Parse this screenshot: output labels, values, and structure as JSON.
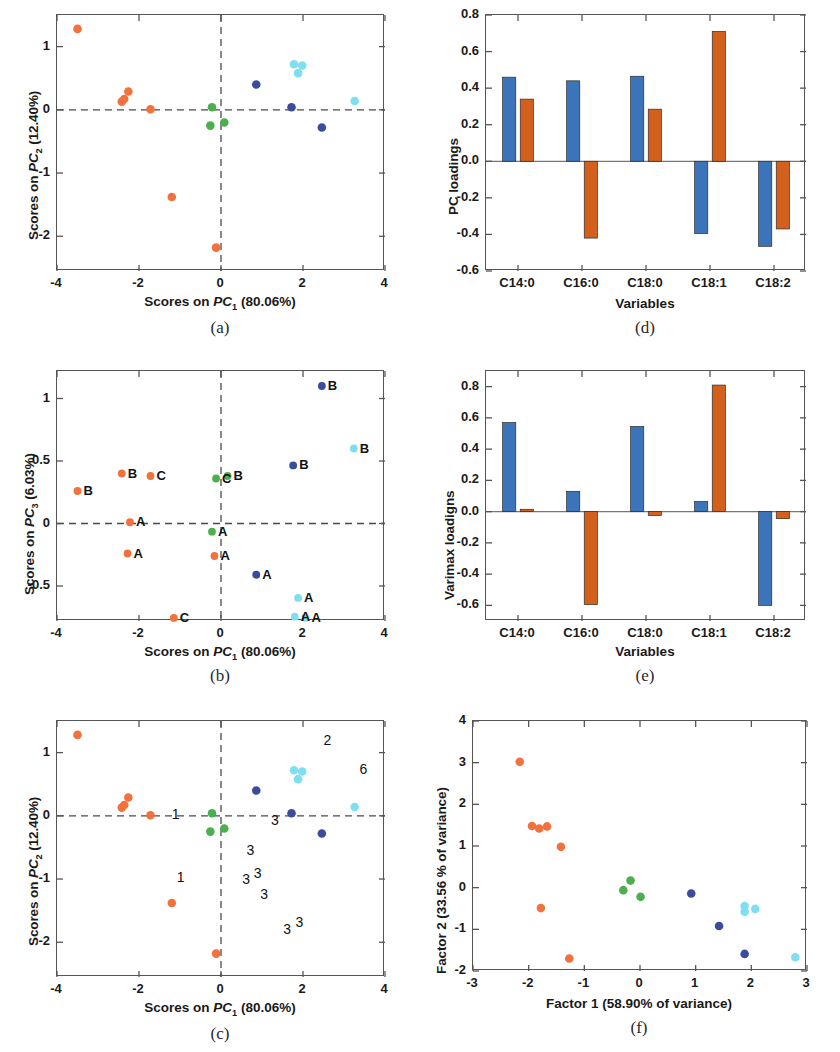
{
  "figure": {
    "panels": [
      "a",
      "b",
      "c",
      "d",
      "e",
      "f"
    ],
    "captions": {
      "a": "(a)",
      "b": "(b)",
      "c": "(c)",
      "d": "(d)",
      "e": "(e)",
      "f": "(f)"
    }
  },
  "colors": {
    "orange_point": "#f2713c",
    "green_point": "#4caf4f",
    "darkblue_point": "#3b4c9e",
    "cyan_point": "#7fdff2",
    "bar_blue": "#3b74b8",
    "bar_orange": "#d4601e",
    "axis": "#555555",
    "dashed": "#4a4a4a"
  },
  "chart_data": [
    {
      "panel": "a",
      "type": "scatter",
      "title": "",
      "xlabel": "Scores on PC1 (80.06%)",
      "ylabel": "Scores on PC2 (12.40%)",
      "xlim": [
        -4,
        4
      ],
      "ylim": [
        -2.55,
        1.5
      ],
      "xticks": [
        -4,
        -2,
        0,
        2,
        4
      ],
      "xticklabels": [
        "-4",
        "-2",
        "0",
        "2",
        "4"
      ],
      "yticks": [
        1,
        0,
        -1,
        -2
      ],
      "yticklabels": [
        "1",
        "0",
        "-1",
        "-2"
      ],
      "grid": false,
      "reference_lines": {
        "hline": 0,
        "vline": 0,
        "style": "dashed"
      },
      "series": [
        {
          "name": "orange",
          "color": "#f2713c",
          "points": [
            [
              -3.5,
              1.28
            ],
            [
              -2.42,
              0.13
            ],
            [
              -2.36,
              0.17
            ],
            [
              -2.26,
              0.29
            ],
            [
              -1.72,
              0.01
            ],
            [
              -1.2,
              -1.38
            ],
            [
              -0.12,
              -2.18
            ]
          ]
        },
        {
          "name": "green",
          "color": "#4caf4f",
          "points": [
            [
              -0.22,
              0.04
            ],
            [
              -0.26,
              -0.25
            ],
            [
              0.08,
              -0.2
            ]
          ]
        },
        {
          "name": "darkblue",
          "color": "#3b4c9e",
          "points": [
            [
              0.86,
              0.4
            ],
            [
              1.72,
              0.04
            ],
            [
              2.46,
              -0.28
            ]
          ]
        },
        {
          "name": "cyan",
          "color": "#7fdff2",
          "points": [
            [
              1.78,
              0.72
            ],
            [
              1.98,
              0.7
            ],
            [
              1.88,
              0.58
            ],
            [
              3.26,
              0.14
            ]
          ]
        }
      ]
    },
    {
      "panel": "b",
      "type": "scatter",
      "title": "",
      "xlabel": "Scores on PC1 (80.06%)",
      "ylabel": "Scores on PC3 (6.03%)",
      "xlim": [
        -4,
        4
      ],
      "ylim": [
        -0.78,
        1.22
      ],
      "xticks": [
        -4,
        -2,
        0,
        2,
        4
      ],
      "xticklabels": [
        "-4",
        "-2",
        "0",
        "2",
        "4"
      ],
      "yticks": [
        1,
        0.5,
        0,
        -0.5
      ],
      "yticklabels": [
        "1",
        "0.5",
        "0",
        "-0.5"
      ],
      "grid": false,
      "reference_lines": {
        "hline": 0,
        "vline": 0,
        "style": "dashed"
      },
      "series": [
        {
          "name": "orange",
          "color": "#f2713c",
          "points": [
            [
              -3.5,
              0.26
            ],
            [
              -2.42,
              0.4
            ],
            [
              -1.72,
              0.38
            ],
            [
              -2.22,
              0.01
            ],
            [
              -2.28,
              -0.24
            ],
            [
              -0.16,
              -0.26
            ],
            [
              -1.15,
              -0.755
            ]
          ]
        },
        {
          "name": "green",
          "color": "#4caf4f",
          "points": [
            [
              -0.12,
              0.36
            ],
            [
              0.16,
              0.38
            ],
            [
              -0.22,
              -0.065
            ]
          ]
        },
        {
          "name": "darkblue",
          "color": "#3b4c9e",
          "points": [
            [
              2.46,
              1.1
            ],
            [
              1.76,
              0.465
            ],
            [
              0.86,
              -0.41
            ]
          ]
        },
        {
          "name": "cyan",
          "color": "#7fdff2",
          "points": [
            [
              3.24,
              0.6
            ],
            [
              1.88,
              -0.595
            ],
            [
              1.8,
              -0.745
            ],
            [
              2.06,
              -0.755
            ]
          ]
        }
      ],
      "point_labels": [
        {
          "text": "B",
          "x": -3.5,
          "y": 0.26
        },
        {
          "text": "B",
          "x": -2.42,
          "y": 0.4
        },
        {
          "text": "C",
          "x": -1.72,
          "y": 0.38
        },
        {
          "text": "A",
          "x": -2.22,
          "y": 0.01
        },
        {
          "text": "A",
          "x": -2.28,
          "y": -0.24
        },
        {
          "text": "C",
          "x": -0.12,
          "y": 0.36
        },
        {
          "text": "B",
          "x": 0.16,
          "y": 0.38
        },
        {
          "text": "A",
          "x": -0.22,
          "y": -0.065
        },
        {
          "text": "A",
          "x": -0.16,
          "y": -0.26
        },
        {
          "text": "C",
          "x": -1.15,
          "y": -0.755
        },
        {
          "text": "B",
          "x": 2.46,
          "y": 1.1
        },
        {
          "text": "B",
          "x": 3.24,
          "y": 0.6
        },
        {
          "text": "B",
          "x": 1.76,
          "y": 0.465
        },
        {
          "text": "A",
          "x": 0.86,
          "y": -0.41
        },
        {
          "text": "A",
          "x": 1.88,
          "y": -0.595
        },
        {
          "text": "A",
          "x": 1.8,
          "y": -0.745
        },
        {
          "text": "A",
          "x": 2.06,
          "y": -0.755
        }
      ]
    },
    {
      "panel": "c",
      "type": "scatter",
      "title": "",
      "xlabel": "Scores on PC1 (80.06%)",
      "ylabel": "Scores on PC2 (12.40%)",
      "xlim": [
        -4,
        4
      ],
      "ylim": [
        -2.55,
        1.5
      ],
      "xticks": [
        -4,
        -2,
        0,
        2,
        4
      ],
      "xticklabels": [
        "-4",
        "-2",
        "0",
        "2",
        "4"
      ],
      "yticks": [
        1,
        0,
        -1,
        -2
      ],
      "yticklabels": [
        "1",
        "0",
        "-1",
        "-2"
      ],
      "grid": false,
      "reference_lines": {
        "hline": 0,
        "vline": 0,
        "style": "dashed"
      },
      "series": [
        {
          "name": "orange",
          "color": "#f2713c",
          "points": [
            [
              -3.5,
              1.28
            ],
            [
              -2.42,
              0.13
            ],
            [
              -2.36,
              0.17
            ],
            [
              -2.26,
              0.29
            ],
            [
              -1.72,
              0.01
            ],
            [
              -1.2,
              -1.38
            ],
            [
              -0.12,
              -2.18
            ]
          ]
        },
        {
          "name": "green",
          "color": "#4caf4f",
          "points": [
            [
              -0.22,
              0.04
            ],
            [
              -0.26,
              -0.25
            ],
            [
              0.08,
              -0.2
            ]
          ]
        },
        {
          "name": "darkblue",
          "color": "#3b4c9e",
          "points": [
            [
              0.86,
              0.4
            ],
            [
              1.72,
              0.04
            ],
            [
              2.46,
              -0.28
            ]
          ]
        },
        {
          "name": "cyan",
          "color": "#7fdff2",
          "points": [
            [
              1.78,
              0.72
            ],
            [
              1.98,
              0.7
            ],
            [
              1.88,
              0.58
            ],
            [
              3.26,
              0.14
            ]
          ]
        }
      ],
      "annotations": [
        {
          "text": "2",
          "x": 2.5,
          "y": 1.18
        },
        {
          "text": "6",
          "x": 3.38,
          "y": 0.73
        },
        {
          "text": "1",
          "x": -1.2,
          "y": 0.02
        },
        {
          "text": "3",
          "x": 1.22,
          "y": -0.08
        },
        {
          "text": "3",
          "x": 0.62,
          "y": -0.55
        },
        {
          "text": "1",
          "x": -1.08,
          "y": -0.98
        },
        {
          "text": "3",
          "x": 0.52,
          "y": -1.02
        },
        {
          "text": "3",
          "x": 0.8,
          "y": -0.92
        },
        {
          "text": "3",
          "x": 0.96,
          "y": -1.25
        },
        {
          "text": "3",
          "x": 1.52,
          "y": -1.8
        },
        {
          "text": "3",
          "x": 1.82,
          "y": -1.7
        }
      ]
    },
    {
      "panel": "d",
      "type": "bar",
      "title": "",
      "xlabel": "Variables",
      "ylabel": "PC loadings",
      "categories": [
        "C14:0",
        "C16:0",
        "C18:0",
        "C18:1",
        "C18:2"
      ],
      "ylim": [
        -0.6,
        0.8
      ],
      "yticks": [
        0.8,
        0.6,
        0.4,
        0.2,
        0.0,
        -0.2,
        -0.4,
        -0.6
      ],
      "yticklabels": [
        "0.8",
        "0.6",
        "0.4",
        "0.2",
        "0.0",
        "-0.2",
        "-0.4",
        "-0.6"
      ],
      "grid": false,
      "series": [
        {
          "name": "PC1",
          "color": "#3b74b8",
          "values": [
            0.46,
            0.44,
            0.465,
            -0.395,
            -0.465
          ]
        },
        {
          "name": "PC2",
          "color": "#d4601e",
          "values": [
            0.34,
            -0.42,
            0.285,
            0.71,
            -0.37
          ]
        }
      ]
    },
    {
      "panel": "e",
      "type": "bar",
      "title": "",
      "xlabel": "Variables",
      "ylabel": "Varimax loadigns",
      "categories": [
        "C14:0",
        "C16:0",
        "C18:0",
        "C18:1",
        "C18:2"
      ],
      "ylim": [
        -0.7,
        0.9
      ],
      "yticks": [
        0.8,
        0.6,
        0.4,
        0.2,
        0.0,
        -0.2,
        -0.4,
        -0.6
      ],
      "yticklabels": [
        "0.8",
        "0.6",
        "0.4",
        "0.2",
        "0.0",
        "-0.2",
        "-0.4",
        "-0.6"
      ],
      "grid": false,
      "series": [
        {
          "name": "Factor1",
          "color": "#3b74b8",
          "values": [
            0.57,
            0.13,
            0.545,
            0.065,
            -0.6
          ]
        },
        {
          "name": "Factor2",
          "color": "#d4601e",
          "values": [
            0.015,
            -0.595,
            -0.025,
            0.81,
            -0.045
          ]
        }
      ]
    },
    {
      "panel": "f",
      "type": "scatter",
      "title": "",
      "xlabel": "Factor 1 (58.90% of variance)",
      "ylabel": "Factor 2 (33.56 % of variance)",
      "xlim": [
        -3,
        3
      ],
      "ylim": [
        -2,
        4
      ],
      "xticks": [
        -3,
        -2,
        -1,
        0,
        1,
        2,
        3
      ],
      "xticklabels": [
        "-3",
        "-2",
        "-1",
        "0",
        "1",
        "2",
        "3"
      ],
      "yticks": [
        4,
        3,
        2,
        1,
        0,
        -1,
        -2
      ],
      "yticklabels": [
        "4",
        "3",
        "2",
        "1",
        "0",
        "-1",
        "-2"
      ],
      "grid": false,
      "series": [
        {
          "name": "orange",
          "color": "#f2713c",
          "points": [
            [
              -2.16,
              3.02
            ],
            [
              -1.94,
              1.48
            ],
            [
              -1.81,
              1.42
            ],
            [
              -1.67,
              1.47
            ],
            [
              -1.42,
              0.98
            ],
            [
              -1.78,
              -0.49
            ],
            [
              -1.27,
              -1.7
            ]
          ]
        },
        {
          "name": "green",
          "color": "#4caf4f",
          "points": [
            [
              -0.3,
              -0.06
            ],
            [
              -0.17,
              0.17
            ],
            [
              0.01,
              -0.22
            ]
          ]
        },
        {
          "name": "darkblue",
          "color": "#3b4c9e",
          "points": [
            [
              0.92,
              -0.14
            ],
            [
              1.42,
              -0.92
            ],
            [
              1.88,
              -1.59
            ]
          ]
        },
        {
          "name": "cyan",
          "color": "#7fdff2",
          "points": [
            [
              1.88,
              -0.44
            ],
            [
              1.88,
              -0.58
            ],
            [
              2.07,
              -0.51
            ],
            [
              2.79,
              -1.67
            ]
          ]
        }
      ]
    }
  ]
}
